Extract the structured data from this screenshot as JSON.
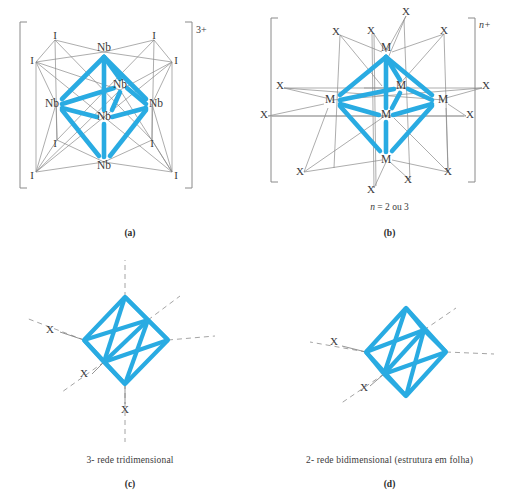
{
  "figure": {
    "title_note": "Metal halide cluster structures",
    "bond_color": "#29ABE2",
    "thin_line_color": "#8a8a8a",
    "dashed_line_color": "#9a9a9a",
    "text_color": "#3a3a3a"
  },
  "panels": [
    {
      "id": "a",
      "letter": "(a)",
      "charge": "3+",
      "charge_italic": false,
      "metal_label": "Nb",
      "ligand_label": "I",
      "metal_count": 6,
      "ligand_count": 8,
      "bracketed": true,
      "caption": "",
      "note": ""
    },
    {
      "id": "b",
      "letter": "(b)",
      "charge": "n+",
      "charge_italic": true,
      "metal_label": "M",
      "ligand_label": "X",
      "metal_count": 6,
      "ligand_count": 12,
      "bracketed": true,
      "caption": "",
      "note_prefix": "n",
      "note_rest": " = 2 ou 3"
    },
    {
      "id": "c",
      "letter": "(c)",
      "charge": "",
      "metal_label": "",
      "ligand_label": "X",
      "metal_count": 6,
      "ligand_count": 3,
      "bracketed": false,
      "caption": "3- rede tridimensional",
      "note": ""
    },
    {
      "id": "d",
      "letter": "(d)",
      "charge": "",
      "metal_label": "",
      "ligand_label": "X",
      "metal_count": 6,
      "ligand_count": 2,
      "bracketed": false,
      "caption": "2- rede bidimensional (estrutura em folha)",
      "note": ""
    }
  ],
  "panel_a": {
    "metals": [
      {
        "label": "Nb",
        "x": 104,
        "y": 48
      },
      {
        "label": "Nb",
        "x": 52,
        "y": 104
      },
      {
        "label": "Nb",
        "x": 156,
        "y": 104
      },
      {
        "label": "Nb",
        "x": 104,
        "y": 117
      },
      {
        "label": "Nb",
        "x": 120,
        "y": 85
      },
      {
        "label": "Nb",
        "x": 104,
        "y": 166
      }
    ],
    "ligands": [
      {
        "label": "I",
        "x": 55,
        "y": 36
      },
      {
        "label": "I",
        "x": 154,
        "y": 36
      },
      {
        "label": "I",
        "x": 32,
        "y": 61
      },
      {
        "label": "I",
        "x": 176,
        "y": 61
      },
      {
        "label": "I",
        "x": 55,
        "y": 144
      },
      {
        "label": "I",
        "x": 152,
        "y": 144
      },
      {
        "label": "I",
        "x": 32,
        "y": 176
      },
      {
        "label": "I",
        "x": 176,
        "y": 176
      }
    ]
  },
  "panel_b": {
    "metals": [
      {
        "label": "M",
        "x": 128,
        "y": 48
      },
      {
        "label": "M",
        "x": 72,
        "y": 100
      },
      {
        "label": "M",
        "x": 185,
        "y": 100
      },
      {
        "label": "M",
        "x": 128,
        "y": 115
      },
      {
        "label": "M",
        "x": 143,
        "y": 86
      },
      {
        "label": "M",
        "x": 128,
        "y": 160
      }
    ],
    "ligands": [
      {
        "label": "X",
        "x": 148,
        "y": 12
      },
      {
        "label": "X",
        "x": 78,
        "y": 32
      },
      {
        "label": "X",
        "x": 113,
        "y": 31
      },
      {
        "label": "X",
        "x": 186,
        "y": 31
      },
      {
        "label": "X",
        "x": 20,
        "y": 86
      },
      {
        "label": "X",
        "x": 228,
        "y": 86
      },
      {
        "label": "X",
        "x": 3,
        "y": 115
      },
      {
        "label": "X",
        "x": 212,
        "y": 115
      },
      {
        "label": "X",
        "x": 40,
        "y": 172
      },
      {
        "label": "X",
        "x": 111,
        "y": 190
      },
      {
        "label": "X",
        "x": 150,
        "y": 180
      },
      {
        "label": "X",
        "x": 190,
        "y": 172
      }
    ]
  },
  "panel_c": {
    "ligands": [
      {
        "label": "X",
        "x": 50,
        "y": 78
      },
      {
        "label": "X",
        "x": 84,
        "y": 122
      },
      {
        "label": "X",
        "x": 123,
        "y": 155
      }
    ],
    "bridge_directions": 6
  },
  "panel_d": {
    "ligands": [
      {
        "label": "X",
        "x": 75,
        "y": 90
      },
      {
        "label": "X",
        "x": 105,
        "y": 136
      }
    ],
    "bridge_directions": 4
  }
}
